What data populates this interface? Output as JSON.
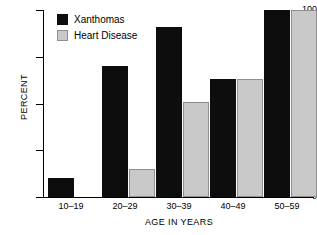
{
  "chart_data": {
    "type": "bar",
    "title": "",
    "xlabel": "AGE IN YEARS",
    "ylabel": "PERCENT",
    "categories": [
      "10–19",
      "20–29",
      "30–39",
      "40–49",
      "50–59"
    ],
    "ylim": [
      0,
      100
    ],
    "yticks": [
      0,
      25,
      50,
      75,
      100
    ],
    "ytick_labels": [
      "0",
      "25",
      "50",
      "75",
      "100"
    ],
    "grid": false,
    "legend_position": "top-left",
    "series": [
      {
        "name": "Xanthomas",
        "color": "#0d0d0d",
        "values": [
          10,
          70,
          91,
          63,
          100
        ]
      },
      {
        "name": "Heart Disease",
        "color": "#c9c9c9",
        "values": [
          null,
          15,
          51,
          63,
          100
        ]
      }
    ]
  },
  "legend": {
    "items": [
      {
        "label": "Xanthomas",
        "swatch": "legend-swatch-black"
      },
      {
        "label": "Heart Disease",
        "swatch": "legend-swatch-gray"
      }
    ]
  }
}
